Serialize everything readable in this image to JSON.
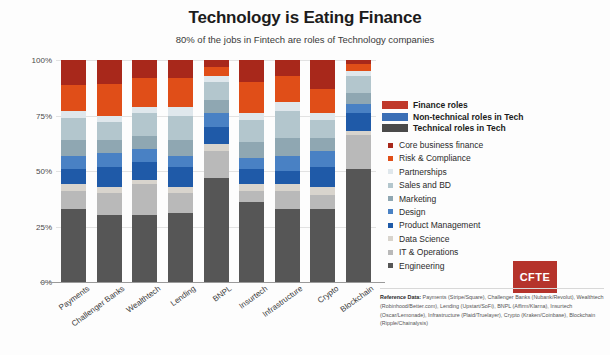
{
  "header": {
    "title": "Technology is Eating Finance",
    "subtitle": "80% of the jobs in Fintech are roles of Technology companies"
  },
  "group_legend": [
    {
      "label": "Finance roles",
      "color": "#c0392b"
    },
    {
      "label": "Non-technical roles in Tech",
      "color": "#3b6fb6"
    },
    {
      "label": "Technical roles in Tech",
      "color": "#4a4a4a"
    }
  ],
  "logo": {
    "text": "CFTE",
    "color": "#b5332b"
  },
  "footnote": {
    "label": "Reference Data:",
    "text": " Payments (Stripe/Square), Challenger Banks (Nubank/Revolut), Wealthtech (Robinhood/Better.com), Lending (Upstart/SoFi), BNPL (Affirm/Klarna), Insurtech (Oscar/Lemonade), Infrastructure (Plaid/Truelayer), Crypto (Kraken/Coinbase), Blockchain (Ripple/Chainalysis)"
  },
  "chart_data": {
    "type": "bar",
    "subtype": "stacked-bar-100-percent",
    "title": "Technology is Eating Finance",
    "subtitle": "80% of the jobs in Fintech are roles of Technology companies",
    "xlabel": "",
    "ylabel": "",
    "ylim": [
      0,
      100
    ],
    "ytick_labels": [
      "0%",
      "25%",
      "50%",
      "75%",
      "100%"
    ],
    "ytick_values": [
      0,
      25,
      50,
      75,
      100
    ],
    "grid": true,
    "legend_position": "right",
    "categories": [
      "Payments",
      "Challenger Banks",
      "Wealthtech",
      "Lending",
      "BNPL",
      "Insurtech",
      "Infrastructure",
      "Crypto",
      "Blockchain"
    ],
    "series": [
      {
        "name": "Engineering",
        "color": "#565656",
        "group": "Technical roles in Tech",
        "values": [
          33,
          30,
          30,
          31,
          47,
          36,
          33,
          33,
          51
        ]
      },
      {
        "name": "IT & Operations",
        "color": "#b9b9b9",
        "group": "Technical roles in Tech",
        "values": [
          8,
          10,
          14,
          9,
          12,
          5,
          8,
          6,
          15
        ]
      },
      {
        "name": "Data Science",
        "color": "#d8d4cd",
        "group": "Technical roles in Tech",
        "values": [
          3,
          3,
          2,
          3,
          3,
          3,
          3,
          4,
          2
        ]
      },
      {
        "name": "Product Management",
        "color": "#1f5aa8",
        "group": "Non-technical roles in Tech",
        "values": [
          7,
          9,
          8,
          9,
          8,
          7,
          6,
          9,
          8
        ]
      },
      {
        "name": "Design",
        "color": "#4981c4",
        "group": "Non-technical roles in Tech",
        "values": [
          6,
          6,
          6,
          5,
          6,
          5,
          7,
          7,
          4
        ]
      },
      {
        "name": "Marketing",
        "color": "#8fa7b2",
        "group": "Non-technical roles in Tech",
        "values": [
          7,
          6,
          6,
          7,
          6,
          7,
          8,
          6,
          5
        ]
      },
      {
        "name": "Sales and BD",
        "color": "#b3c6cd",
        "group": "Non-technical roles in Tech",
        "values": [
          10,
          8,
          10,
          11,
          8,
          10,
          12,
          8,
          8
        ]
      },
      {
        "name": "Partnerships",
        "color": "#dfe7ec",
        "group": "Non-technical roles in Tech",
        "values": [
          3,
          3,
          3,
          4,
          3,
          3,
          4,
          3,
          2
        ]
      },
      {
        "name": "Risk & Compliance",
        "color": "#e04e18",
        "group": "Finance roles",
        "values": [
          12,
          14,
          13,
          13,
          4,
          14,
          12,
          11,
          3
        ]
      },
      {
        "name": "Core business finance",
        "color": "#a8281b",
        "group": "Finance roles",
        "values": [
          11,
          11,
          8,
          8,
          3,
          10,
          7,
          13,
          2
        ]
      }
    ]
  }
}
